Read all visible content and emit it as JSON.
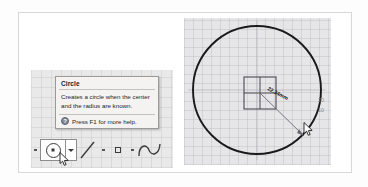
{
  "app": {
    "kind": "cad-drawing-tool-tooltip",
    "background_color": "#ffffff"
  },
  "tooltip": {
    "title": "Circle",
    "description_line1": "Creates a circle when the center",
    "description_line2": "and the radius are known.",
    "help_icon": "help-question-icon",
    "help_text": "Press F1 for more help.",
    "background_color": "#f4f3f1",
    "border_color": "#9a9a9a"
  },
  "toolbar": {
    "items": [
      {
        "name": "dot-separator-1",
        "icon": "small-square-icon",
        "label": ""
      },
      {
        "name": "circle-tool",
        "icon": "circle-with-center-dot-icon",
        "label": "Circle",
        "selected": true
      },
      {
        "name": "circle-tool-dropdown",
        "icon": "chevron-down-icon",
        "label": ""
      },
      {
        "name": "line-tool",
        "icon": "diagonal-line-icon",
        "label": "Line"
      },
      {
        "name": "dot-separator-2",
        "icon": "small-square-icon",
        "label": ""
      },
      {
        "name": "rectangle-tool",
        "icon": "square-outline-icon",
        "label": "Rectangle"
      },
      {
        "name": "dot-separator-3",
        "icon": "small-square-icon",
        "label": ""
      },
      {
        "name": "spline-tool",
        "icon": "spline-curve-icon",
        "label": "Spline"
      }
    ]
  },
  "canvas": {
    "dimension_label": "22.34mm",
    "ruler_marks": [
      "20",
      "10"
    ],
    "grid_color": "#aaaaaf",
    "geometry_color": "#1a1a1a",
    "center_square": "origin-marker",
    "cursor": "arrow-cursor"
  }
}
